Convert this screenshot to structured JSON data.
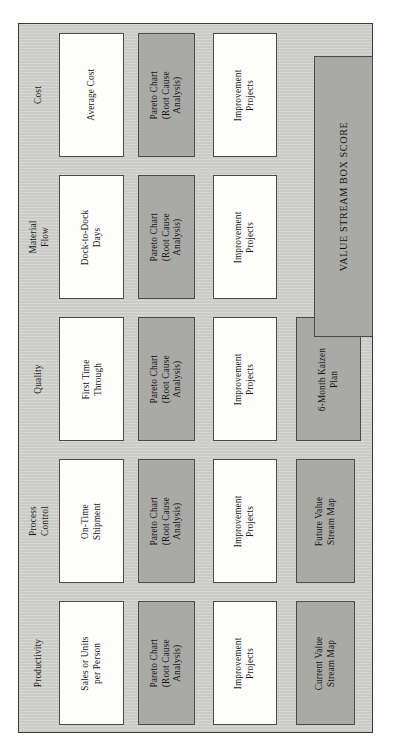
{
  "figure": {
    "orientation": "rotated-90-ccw",
    "panel_background": "#cfcfcb",
    "white_cell_color": "#fdfdfb",
    "gray_cell_color": "#a9a9a6",
    "border_color": "#4a4a48"
  },
  "box_score": {
    "label": "VALUE STREAM BOX SCORE"
  },
  "categories": [
    {
      "id": "productivity",
      "header": "Productivity",
      "metric": "Sales or Units\nper Person",
      "pareto": "Pareto Chart\n(Root Cause\nAnalysis)",
      "projects": "Improvement\nProjects",
      "extra": "Current Value\nStream Map",
      "extra_style": "gray"
    },
    {
      "id": "process-control",
      "header": "Process\nControl",
      "metric": "On-Time\nShipment",
      "pareto": "Pareto Chart\n(Root Cause\nAnalysis)",
      "projects": "Improvement\nProjects",
      "extra": "Future Value\nStream Map",
      "extra_style": "gray"
    },
    {
      "id": "quality",
      "header": "Quality",
      "metric": "First Time\nThrough",
      "pareto": "Pareto Chart\n(Root Cause\nAnalysis)",
      "projects": "Improvement\nProjects",
      "extra": "6-Month Kaizen\nPlan",
      "extra_style": "gray"
    },
    {
      "id": "material-flow",
      "header": "Material\nFlow",
      "metric": "Dock-to-Dock\nDays",
      "pareto": "Pareto Chart\n(Root Cause\nAnalysis)",
      "projects": "Improvement\nProjects",
      "extra": "",
      "extra_style": "none"
    },
    {
      "id": "cost",
      "header": "Cost",
      "metric": "Average Cost",
      "pareto": "Pareto Chart\n(Root Cause\nAnalysis)",
      "projects": "Improvement\nProjects",
      "extra": "",
      "extra_style": "none"
    }
  ]
}
